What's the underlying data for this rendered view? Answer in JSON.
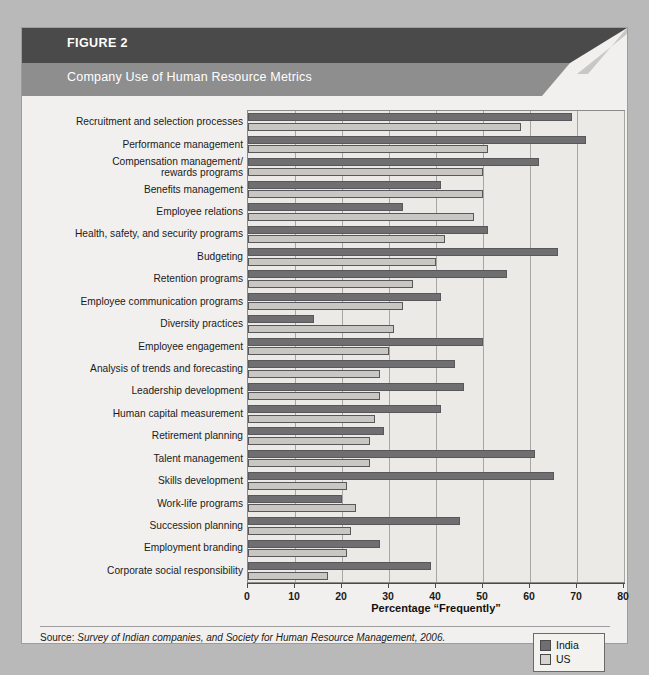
{
  "figure": {
    "label": "FIGURE 2",
    "subtitle": "Company Use of Human Resource Metrics",
    "source_lead": "Source: ",
    "source_body": "Survey of Indian companies, and Society for Human Resource Management, 2006."
  },
  "legend": {
    "items": [
      {
        "name": "India",
        "color": "#6f6f72"
      },
      {
        "name": "US",
        "color": "#d5d3d0"
      }
    ]
  },
  "chart_data": {
    "type": "bar",
    "orientation": "horizontal",
    "title": "Company Use of Human Resource Metrics",
    "xlabel": "Percentage “Frequently”",
    "ylabel": "",
    "xlim": [
      0,
      80
    ],
    "xticks": [
      0,
      10,
      20,
      30,
      40,
      50,
      60,
      70,
      80
    ],
    "grid": true,
    "legend_position": "bottom-right",
    "categories": [
      "Recruitment and selection processes",
      "Performance management",
      "Compensation management/ rewards programs",
      "Benefits management",
      "Employee relations",
      "Health, safety, and security programs",
      "Budgeting",
      "Retention programs",
      "Employee communication programs",
      "Diversity practices",
      "Employee engagement",
      "Analysis of trends and forecasting",
      "Leadership development",
      "Human capital  measurement",
      "Retirement planning",
      "Talent management",
      "Skills development",
      "Work-life programs",
      "Succession planning",
      "Employment branding",
      "Corporate social responsibility"
    ],
    "series": [
      {
        "name": "India",
        "color": "#6f6f72",
        "values": [
          69,
          72,
          62,
          41,
          33,
          51,
          66,
          55,
          41,
          14,
          50,
          44,
          46,
          41,
          29,
          61,
          65,
          20,
          45,
          28,
          39
        ]
      },
      {
        "name": "US",
        "color": "#d5d3d0",
        "values": [
          58,
          51,
          50,
          50,
          48,
          42,
          40,
          35,
          33,
          31,
          30,
          28,
          28,
          27,
          26,
          26,
          21,
          23,
          22,
          21,
          17
        ]
      }
    ]
  }
}
